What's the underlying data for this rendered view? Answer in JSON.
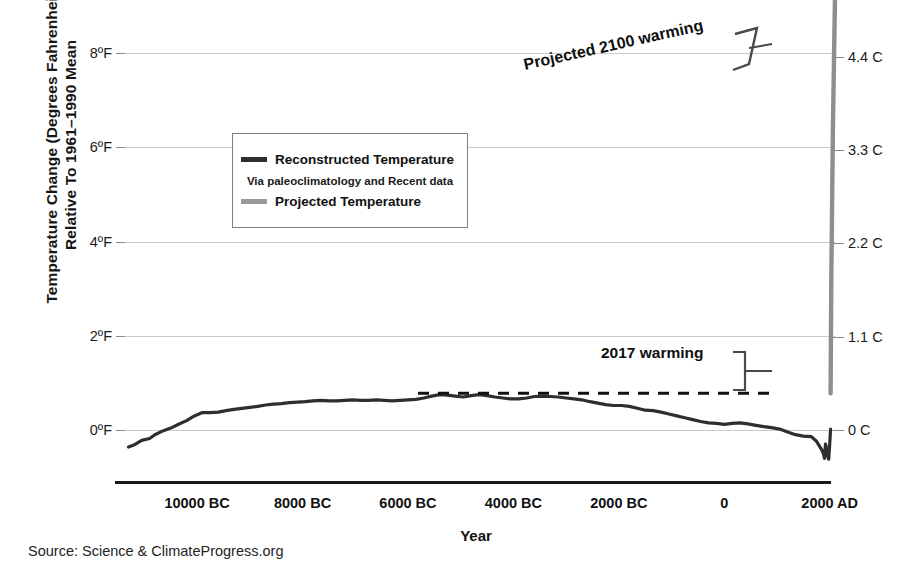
{
  "chart_data": {
    "type": "line",
    "title": "",
    "xlabel": "Year",
    "ylabel_line1": "Temperature Change (Degrees Fahrenheit)",
    "ylabel_line2": "Relative To 1961–1990 Mean",
    "source": "Source: Science & ClimateProgress.org",
    "grid": true,
    "xlim": [
      -11500,
      2100
    ],
    "ylim_f": [
      -1.2,
      8.6
    ],
    "y_ticks_fahrenheit": [
      "8ºF",
      "6ºF",
      "4ºF",
      "2ºF",
      "0ºF"
    ],
    "y_tick_values_f": [
      8,
      6,
      4,
      2,
      0
    ],
    "y_ticks_celsius": [
      "4.4 C",
      "3.3 C",
      "2.2 C",
      "1.1 C",
      "0 C"
    ],
    "y_tick_values_c": [
      4.4,
      3.3,
      2.2,
      1.1,
      0
    ],
    "x_ticks": [
      "10000 BC",
      "8000 BC",
      "6000 BC",
      "4000 BC",
      "2000 BC",
      "0",
      "2000 AD"
    ],
    "x_tick_values": [
      -10000,
      -8000,
      -6000,
      -4000,
      -2000,
      0,
      2000
    ],
    "legend": {
      "position": "upper-left-inset",
      "entries": [
        {
          "name": "Reconstructed Temperature",
          "color": "#2e2e2e",
          "note": "Via paleoclimatology and Recent data"
        },
        {
          "name": "Projected Temperature",
          "color": "#9a9a9a"
        }
      ]
    },
    "annotations": [
      {
        "name": "projected-2100-warming",
        "text": "Projected 2100 warming",
        "rotation_deg": -12.5
      },
      {
        "name": "2017-warming",
        "text": "2017 warming"
      },
      {
        "name": "2017-reference-dashed-line",
        "text": "",
        "value_f": 0.78,
        "style": "dashed"
      }
    ],
    "series": [
      {
        "name": "Reconstructed Temperature",
        "color": "#2e2e2e",
        "x": [
          -11300,
          -11200,
          -11050,
          -10900,
          -10800,
          -10650,
          -10500,
          -10350,
          -10200,
          -10050,
          -9900,
          -9750,
          -9600,
          -9450,
          -9300,
          -9150,
          -9000,
          -8850,
          -8700,
          -8550,
          -8400,
          -8250,
          -8100,
          -7950,
          -7800,
          -7650,
          -7500,
          -7350,
          -7200,
          -7050,
          -6900,
          -6750,
          -6600,
          -6450,
          -6300,
          -6150,
          -6000,
          -5850,
          -5700,
          -5550,
          -5400,
          -5250,
          -5100,
          -4950,
          -4800,
          -4650,
          -4500,
          -4350,
          -4200,
          -4050,
          -3900,
          -3750,
          -3600,
          -3450,
          -3300,
          -3150,
          -3000,
          -2850,
          -2700,
          -2550,
          -2400,
          -2250,
          -2100,
          -1950,
          -1800,
          -1650,
          -1500,
          -1350,
          -1200,
          -1050,
          -900,
          -750,
          -600,
          -450,
          -300,
          -150,
          0,
          150,
          300,
          450,
          600,
          750,
          900,
          1050,
          1200,
          1350,
          1500,
          1650,
          1750,
          1800,
          1850,
          1880,
          1900,
          1920,
          1940,
          1960,
          1980,
          2000,
          2017
        ],
        "y_f": [
          -0.36,
          -0.32,
          -0.22,
          -0.18,
          -0.1,
          -0.02,
          0.04,
          0.12,
          0.2,
          0.3,
          0.37,
          0.37,
          0.38,
          0.41,
          0.44,
          0.46,
          0.48,
          0.5,
          0.53,
          0.55,
          0.56,
          0.58,
          0.59,
          0.6,
          0.62,
          0.63,
          0.62,
          0.62,
          0.63,
          0.64,
          0.63,
          0.63,
          0.64,
          0.63,
          0.62,
          0.63,
          0.64,
          0.65,
          0.68,
          0.72,
          0.75,
          0.74,
          0.72,
          0.7,
          0.73,
          0.75,
          0.73,
          0.7,
          0.68,
          0.66,
          0.66,
          0.68,
          0.71,
          0.72,
          0.71,
          0.7,
          0.68,
          0.66,
          0.64,
          0.6,
          0.57,
          0.54,
          0.52,
          0.52,
          0.5,
          0.46,
          0.42,
          0.41,
          0.38,
          0.34,
          0.3,
          0.26,
          0.22,
          0.18,
          0.15,
          0.14,
          0.12,
          0.14,
          0.15,
          0.13,
          0.1,
          0.07,
          0.05,
          0.02,
          -0.04,
          -0.1,
          -0.13,
          -0.14,
          -0.24,
          -0.33,
          -0.42,
          -0.5,
          -0.6,
          -0.3,
          -0.4,
          -0.55,
          -0.62,
          -0.3,
          0.02,
          0.3,
          0.78
        ],
        "linewidth": 3
      },
      {
        "name": "Projected Temperature",
        "color": "#8e8e8e",
        "x": [
          2017,
          2030,
          2060,
          2100
        ],
        "y_f": [
          0.78,
          3.2,
          6.4,
          9.2
        ],
        "linewidth": 4,
        "note": "near-vertical spike at right edge extending off the top of the plot"
      }
    ]
  }
}
